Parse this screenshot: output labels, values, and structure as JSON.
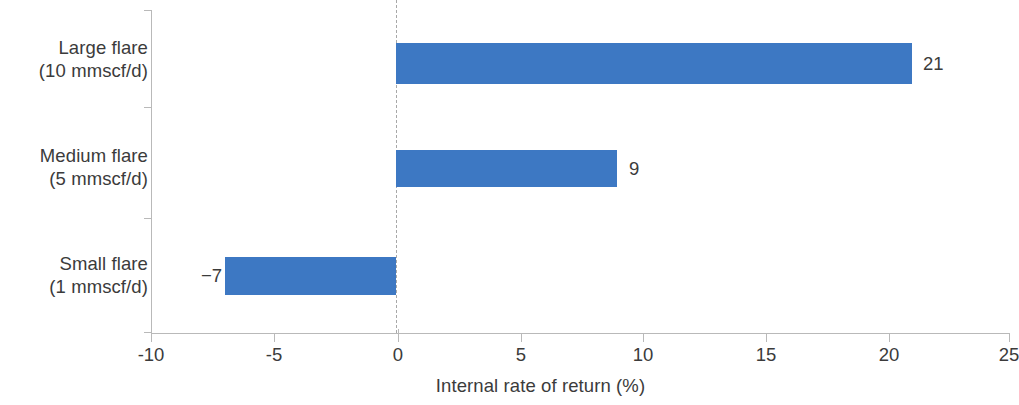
{
  "chart_data": {
    "type": "bar",
    "orientation": "horizontal",
    "title": "",
    "subtitle": "",
    "xlabel": "Internal rate of return (%)",
    "ylabel": "",
    "categories": [
      "Large flare (10 mmscf/d)",
      "Medium flare (5 mmscf/d)",
      "Small flare (1 mmscf/d)"
    ],
    "category_lines": [
      [
        "Large flare",
        "(10 mmscf/d)"
      ],
      [
        "Medium flare",
        "(5 mmscf/d)"
      ],
      [
        "Small flare",
        "(1 mmscf/d)"
      ]
    ],
    "values": [
      21,
      9,
      -7
    ],
    "data_labels": [
      "21",
      "9",
      "−7"
    ],
    "xlim": [
      -10,
      25
    ],
    "xticks": [
      -10,
      -5,
      0,
      5,
      10,
      15,
      20,
      25
    ],
    "xtick_labels": [
      "-10",
      "-5",
      "0",
      "5",
      "10",
      "15",
      "20",
      "25"
    ],
    "grid": false,
    "zero_reference_line": true,
    "legend": null,
    "series": [
      {
        "name": "Internal rate of return (%)",
        "values": [
          21,
          9,
          -7
        ],
        "color": "#3d78c3"
      }
    ],
    "colors": {
      "bar": "#3d78c3",
      "axis": "#b9b9b9",
      "zero_line": "#a8a8a8",
      "text": "#3b3b3b",
      "background": "#ffffff"
    }
  }
}
